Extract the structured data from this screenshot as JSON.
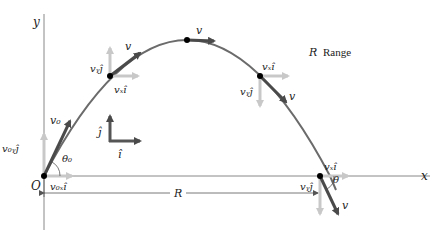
{
  "diagram": {
    "axes": {
      "x_label": "x",
      "y_label": "y",
      "origin_label": "O"
    },
    "legend": {
      "symbol": "R",
      "text": "Range"
    },
    "range_label": "R",
    "unit_vectors": {
      "i_label": "î",
      "j_label": "ĵ"
    },
    "points": [
      {
        "id": "launch",
        "v_label": "v₀",
        "vx_label": "v₀ₓî",
        "vy_label": "v₀ᵧĵ",
        "angle_label": "θ₀"
      },
      {
        "id": "rising",
        "v_label": "v",
        "vx_label": "vₓî",
        "vy_label": "vᵧĵ"
      },
      {
        "id": "apex",
        "v_label": "v"
      },
      {
        "id": "falling",
        "v_label": "v",
        "vx_label": "vₓî",
        "vy_label": "vᵧĵ"
      },
      {
        "id": "landing",
        "v_label": "v",
        "vx_label": "vₓî",
        "vy_label": "vᵧĵ",
        "angle_label": "θ"
      }
    ],
    "colors": {
      "trajectory": "#6b6b6b",
      "velocity": "#4a4a4a",
      "component": "#c8c8c8",
      "axis": "#888888",
      "point": "#000000"
    }
  }
}
